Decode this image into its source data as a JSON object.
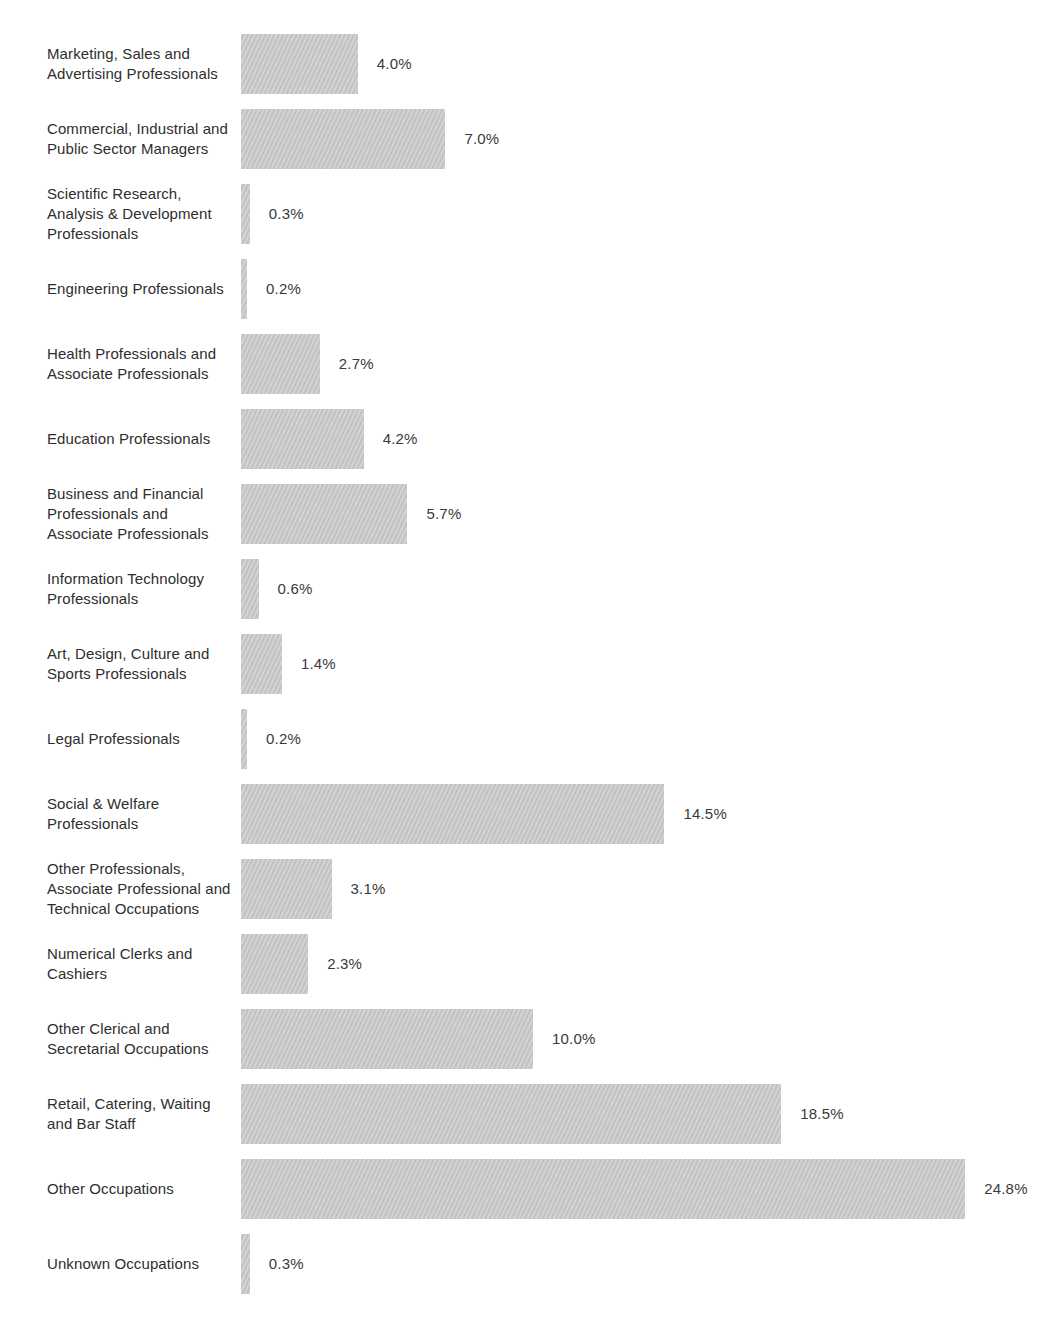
{
  "chart_data": {
    "type": "bar",
    "orientation": "horizontal",
    "title": "",
    "xlabel": "",
    "ylabel": "",
    "unit": "%",
    "xlim": [
      0,
      26
    ],
    "grid": false,
    "legend": false,
    "bar_color": "#c9c9c9",
    "text_color": "#2e2e2e",
    "background_color": "#ffffff",
    "categories": [
      "Marketing, Sales and Advertising Professionals",
      "Commercial, Industrial and Public Sector Managers",
      "Scientific Research, Analysis & Development Professionals",
      "Engineering Professionals",
      "Health Professionals and Associate Professionals",
      "Education Professionals",
      "Business and Financial Professionals and Associate Professionals",
      "Information Technology Professionals",
      "Art, Design, Culture and Sports Professionals",
      "Legal Professionals",
      "Social & Welfare Professionals",
      "Other Professionals, Associate Professional and Technical Occupations",
      "Numerical Clerks and Cashiers",
      "Other Clerical and Secretarial Occupations",
      "Retail, Catering, Waiting and Bar Staff",
      "Other Occupations",
      "Unknown Occupations"
    ],
    "label_lines": [
      [
        "Marketing, Sales and",
        "Advertising Professionals"
      ],
      [
        "Commercial, Industrial and",
        "Public Sector Managers"
      ],
      [
        "Scientific Research,",
        "Analysis & Development",
        "Professionals"
      ],
      [
        "Engineering Professionals"
      ],
      [
        "Health Professionals and",
        "Associate Professionals"
      ],
      [
        "Education Professionals"
      ],
      [
        "Business and Financial",
        "Professionals and",
        "Associate Professionals"
      ],
      [
        "Information Technology",
        "Professionals"
      ],
      [
        "Art, Design, Culture and",
        "Sports Professionals"
      ],
      [
        "Legal Professionals"
      ],
      [
        "Social & Welfare",
        "Professionals"
      ],
      [
        "Other Professionals,",
        "Associate Professional and",
        "Technical Occupations"
      ],
      [
        "Numerical Clerks and",
        "Cashiers"
      ],
      [
        "Other Clerical and",
        "Secretarial Occupations"
      ],
      [
        "Retail, Catering, Waiting",
        "and Bar Staff"
      ],
      [
        "Other Occupations"
      ],
      [
        "Unknown Occupations"
      ]
    ],
    "values": [
      4.0,
      7.0,
      0.3,
      0.2,
      2.7,
      4.2,
      5.7,
      0.6,
      1.4,
      0.2,
      14.5,
      3.1,
      2.3,
      10.0,
      18.5,
      24.8,
      0.3
    ],
    "value_labels": [
      "4.0%",
      "7.0%",
      "0.3%",
      "0.2%",
      "2.7%",
      "4.2%",
      "5.7%",
      "0.6%",
      "1.4%",
      "0.2%",
      "14.5%",
      "3.1%",
      "2.3%",
      "10.0%",
      "18.5%",
      "24.8%",
      "0.3%"
    ]
  }
}
